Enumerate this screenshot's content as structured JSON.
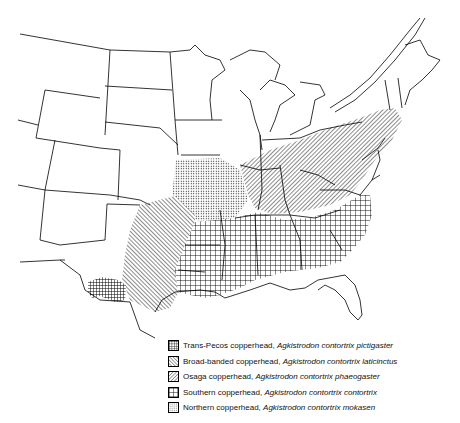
{
  "figure": {
    "type": "range-map"
  },
  "legend": {
    "items": [
      {
        "pattern": "dense-crosshatch",
        "common": "Trans-Pecos copperhead, ",
        "scientific": "Agkistrodon contortrix pictigaster"
      },
      {
        "pattern": "forward-diagonal",
        "common": "Broad-banded copperhead, ",
        "scientific": "Agkistrodon contortrix laticinctus"
      },
      {
        "pattern": "backward-diagonal",
        "common": "Osaga copperhead, ",
        "scientific": "Agkistrodon contortrix phaeogaster"
      },
      {
        "pattern": "open-grid",
        "common": "Southern copperhead, ",
        "scientific": "Agkistrodon contortrix contortrix"
      },
      {
        "pattern": "stipple",
        "common": "Northern copperhead, ",
        "scientific": "Agkistrodon contortrix mokasen"
      }
    ]
  },
  "colors": {
    "line": "#000000",
    "background": "#ffffff"
  }
}
